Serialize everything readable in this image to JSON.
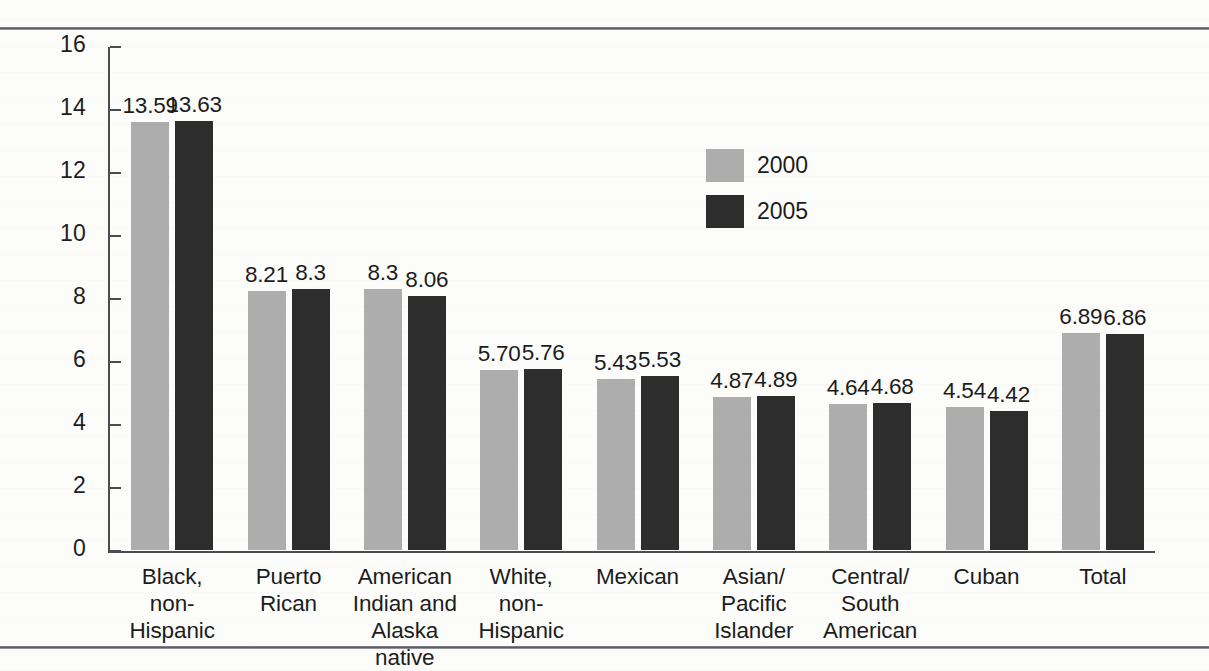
{
  "figure": {
    "background_color": "#fcfcfb",
    "rules": [
      "top-rule",
      "bottom-rule"
    ]
  },
  "chart_data": {
    "type": "bar",
    "title": "",
    "subtitle": "",
    "xlabel": "",
    "ylabel": "",
    "ylim": [
      0,
      16
    ],
    "yticks": [
      0,
      2,
      4,
      6,
      8,
      10,
      12,
      14,
      16
    ],
    "ytick_labels": [
      "0",
      "2",
      "4",
      "6",
      "8",
      "10",
      "12",
      "14",
      "16"
    ],
    "grid": false,
    "legend_position": "inside-upper-center-right",
    "categories": [
      "Black,\nnon-Hispanic",
      "Puerto\nRican",
      "American\nIndian and\nAlaska native",
      "White,\nnon-Hispanic",
      "Mexican",
      "Asian/\nPacific\nIslander",
      "Central/\nSouth\nAmerican",
      "Cuban",
      "Total"
    ],
    "series": [
      {
        "name": "2000",
        "color": "#adadad",
        "values": [
          13.59,
          8.21,
          8.3,
          5.7,
          5.43,
          4.87,
          4.64,
          4.54,
          6.89
        ],
        "labels": [
          "13.59",
          "8.21",
          "8.3",
          "5.70",
          "5.43",
          "4.87",
          "4.64",
          "4.54",
          "6.89"
        ]
      },
      {
        "name": "2005",
        "color": "#2d2d2d",
        "values": [
          13.63,
          8.3,
          8.06,
          5.76,
          5.53,
          4.89,
          4.68,
          4.42,
          6.86
        ],
        "labels": [
          "13.63",
          "8.3",
          "8.06",
          "5.76",
          "5.53",
          "4.89",
          "4.68",
          "4.42",
          "6.86"
        ]
      }
    ]
  },
  "legend": {
    "entries": [
      {
        "label": "2000",
        "color": "#adadad"
      },
      {
        "label": "2005",
        "color": "#2d2d2d"
      }
    ]
  }
}
